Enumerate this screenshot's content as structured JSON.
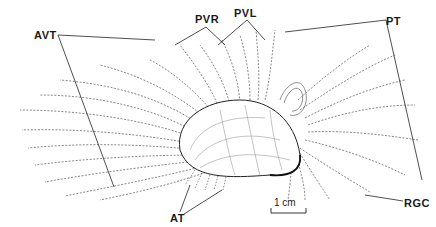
{
  "figure": {
    "labels": [
      {
        "id": "AVT",
        "text": "AVT",
        "x": 34,
        "y": 29
      },
      {
        "id": "PVR",
        "text": "PVR",
        "x": 195,
        "y": 13
      },
      {
        "id": "PVL",
        "text": "PVL",
        "x": 234,
        "y": 7
      },
      {
        "id": "PT",
        "text": "PT",
        "x": 386,
        "y": 15
      },
      {
        "id": "RGC",
        "text": "RGC",
        "x": 404,
        "y": 197
      },
      {
        "id": "AT",
        "text": "AT",
        "x": 170,
        "y": 212
      }
    ],
    "scale_bar": {
      "text": "1 cm",
      "x1": 271,
      "x2": 306,
      "y": 213
    }
  }
}
